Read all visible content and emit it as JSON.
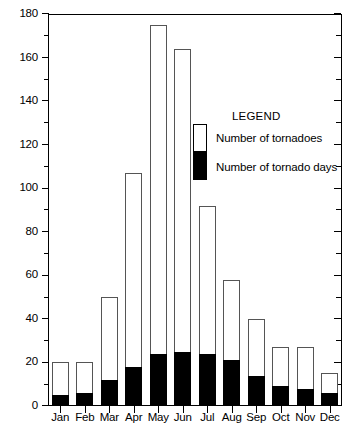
{
  "chart_data": {
    "type": "bar",
    "stacked": "overlay",
    "title": "",
    "xlabel": "",
    "ylabel": "",
    "ylim": [
      0,
      180
    ],
    "y_major_step": 20,
    "y_minor_step": 10,
    "grid": false,
    "categories": [
      "Jan",
      "Feb",
      "Mar",
      "Apr",
      "May",
      "Jun",
      "Jul",
      "Aug",
      "Sep",
      "Oct",
      "Nov",
      "Dec"
    ],
    "y_tick_labels": [
      "0",
      "20",
      "40",
      "60",
      "80",
      "100",
      "120",
      "140",
      "160",
      "180"
    ],
    "y_tick_values": [
      0,
      20,
      40,
      60,
      80,
      100,
      120,
      140,
      160,
      180
    ],
    "series": [
      {
        "name": "Number of tornadoes",
        "color": "#ffffff",
        "edge_color": "#555555",
        "values": [
          20,
          20,
          50,
          107,
          175,
          164,
          92,
          58,
          40,
          27,
          27,
          15
        ]
      },
      {
        "name": "Number of tornado days",
        "color": "#000000",
        "edge_color": "#000000",
        "values": [
          5,
          6,
          12,
          18,
          24,
          25,
          24,
          21,
          14,
          9,
          8,
          6
        ]
      }
    ],
    "legend": {
      "title": "LEGEND",
      "position": "inside-upper-right",
      "entries": [
        {
          "label": "Number of tornadoes",
          "swatch": "white"
        },
        {
          "label": "Number of tornado days",
          "swatch": "black"
        }
      ]
    }
  }
}
